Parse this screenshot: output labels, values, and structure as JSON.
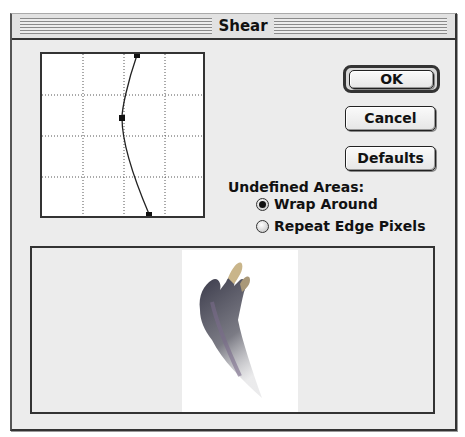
{
  "window": {
    "title": "Shear"
  },
  "graph": {
    "grid_divisions": 4,
    "control_points": [
      {
        "x": 97,
        "y": 1
      },
      {
        "x": 82,
        "y": 64
      },
      {
        "x": 109,
        "y": 166
      }
    ]
  },
  "buttons": {
    "ok_label": "OK",
    "cancel_label": "Cancel",
    "defaults_label": "Defaults"
  },
  "undefined_areas": {
    "label": "Undefined Areas:",
    "options": [
      {
        "label": "Wrap Around",
        "selected": true
      },
      {
        "label": "Repeat Edge Pixels",
        "selected": false
      }
    ]
  },
  "preview": {
    "description": "hand-shaped brush stroke preview"
  }
}
